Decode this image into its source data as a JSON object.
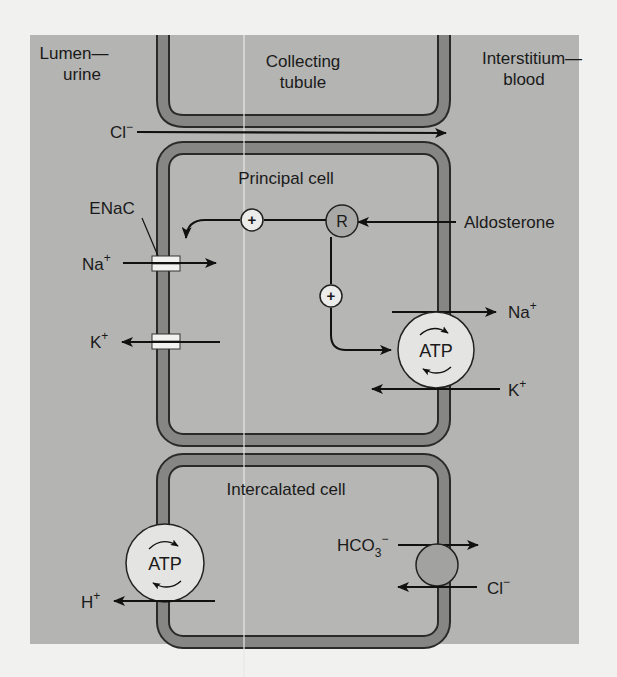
{
  "colors": {
    "page_bg": "#f1f1ef",
    "panel_bg": "#b4b4b2",
    "membrane_fill": "#868684",
    "membrane_edge": "#2a2a2a",
    "cell_interior": "#b6b6b4",
    "circle_fill": "#e4e4e2",
    "exchanger_fill": "#a2a2a0",
    "channel_fill": "#f2f2f0",
    "line": "#111111"
  },
  "regions": {
    "lumen": {
      "line1": "Lumen—",
      "line2": "urine"
    },
    "tubule": {
      "line1": "Collecting",
      "line2": "tubule"
    },
    "interstitium": {
      "line1": "Interstitium—",
      "line2": "blood"
    }
  },
  "paracellular": {
    "ion": "Cl",
    "charge": "−"
  },
  "principal_cell": {
    "title": "Principal cell",
    "channel_label": "ENaC",
    "na_in": {
      "ion": "Na",
      "charge": "+"
    },
    "k_out": {
      "ion": "K",
      "charge": "+"
    },
    "receptor": "R",
    "stimulus": "Aldosterone",
    "plus_sign": "+",
    "pump_label": "ATP",
    "pump_na": {
      "ion": "Na",
      "charge": "+"
    },
    "pump_k": {
      "ion": "K",
      "charge": "+"
    }
  },
  "intercalated_cell": {
    "title": "Intercalated cell",
    "pump_label": "ATP",
    "h_out": {
      "ion": "H",
      "charge": "+"
    },
    "bicarbonate": {
      "ion": "HCO",
      "sub": "3",
      "charge": "−"
    },
    "chloride": {
      "ion": "Cl",
      "charge": "−"
    }
  }
}
